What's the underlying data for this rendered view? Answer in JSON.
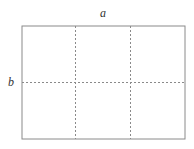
{
  "diagram": {
    "labels": {
      "top": "a",
      "left": "b"
    },
    "grid": {
      "columns": 3,
      "rows": 2
    },
    "colors": {
      "outline": "#8a8a8a",
      "dashes": "#8a8a8a",
      "text": "#333333"
    }
  }
}
